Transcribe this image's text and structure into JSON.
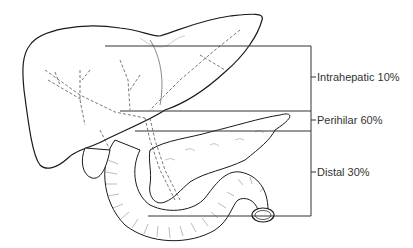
{
  "diagram": {
    "colors": {
      "line": "#333333",
      "outline": "#1a1a1a",
      "duct": "#555555",
      "background": "#ffffff"
    },
    "labels": [
      {
        "id": "intrahepatic",
        "text": "Intrahepatic 10%",
        "x": 315,
        "y": 71
      },
      {
        "id": "perihilar",
        "text": "Perihilar 60%",
        "x": 315,
        "y": 114
      },
      {
        "id": "distal",
        "text": "Distal 30%",
        "x": 315,
        "y": 166
      }
    ],
    "bracket": {
      "vertical_x": 311,
      "top_y": 46,
      "bottom_y": 216,
      "lines_y": [
        46,
        111,
        131,
        216
      ],
      "ticks_y": [
        77,
        120,
        172
      ]
    },
    "organs": [
      "liver",
      "gallbladder",
      "common-bile-duct",
      "pancreas",
      "duodenum"
    ]
  }
}
